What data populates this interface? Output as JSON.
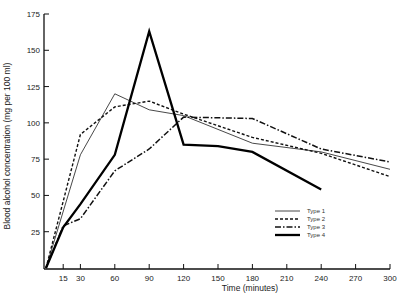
{
  "chart_data": {
    "type": "line",
    "title": "",
    "xlabel": "Time (minutes)",
    "ylabel": "Blood alcohol concentration (mg per 100 ml)",
    "xlim": [
      0,
      300
    ],
    "ylim": [
      0,
      175
    ],
    "x_ticks": [
      15,
      30,
      60,
      90,
      120,
      150,
      180,
      210,
      240,
      270,
      300
    ],
    "y_ticks": [
      25,
      50,
      75,
      100,
      125,
      150,
      175
    ],
    "grid": false,
    "legend_position": "right-middle",
    "series": [
      {
        "name": "Type 1",
        "style": "thin-solid",
        "x": [
          0,
          30,
          60,
          90,
          120,
          180,
          240,
          300
        ],
        "y": [
          0,
          78,
          120,
          109,
          105,
          86,
          80,
          68
        ]
      },
      {
        "name": "Type 2",
        "style": "dashed",
        "x": [
          0,
          30,
          60,
          90,
          120,
          180,
          240,
          300
        ],
        "y": [
          0,
          92,
          111,
          115,
          106,
          90,
          79,
          63
        ]
      },
      {
        "name": "Type 3",
        "style": "dash-dot",
        "x": [
          0,
          15,
          30,
          60,
          90,
          120,
          180,
          240,
          300
        ],
        "y": [
          0,
          29,
          34,
          67,
          82,
          104,
          103,
          82,
          73
        ]
      },
      {
        "name": "Type 4",
        "style": "thick-solid",
        "x": [
          0,
          15,
          30,
          60,
          90,
          120,
          150,
          180,
          240
        ],
        "y": [
          0,
          28,
          44,
          78,
          163,
          85,
          84,
          80,
          54
        ]
      }
    ]
  }
}
